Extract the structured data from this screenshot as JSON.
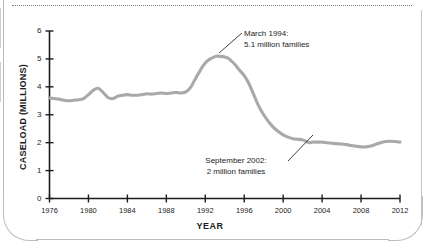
{
  "figure": {
    "y_axis_title": "CASELOAD (MILLIONS)",
    "x_axis_title": "YEAR",
    "line_color": "#a9a9a9",
    "text_color": "#1c1c1c"
  },
  "annotations": {
    "peak": {
      "line1": "March 1994:",
      "line2": "5.1 million families"
    },
    "trough": {
      "line1": "September 2002:",
      "line2": "2 million families"
    }
  },
  "chart_data": {
    "type": "line",
    "title": "",
    "xlabel": "YEAR",
    "ylabel": "CASELOAD (MILLIONS)",
    "xlim": [
      1976,
      2012
    ],
    "ylim": [
      0,
      6
    ],
    "xticks": [
      1976,
      1980,
      1984,
      1988,
      1992,
      1996,
      2000,
      2004,
      2008,
      2012
    ],
    "yticks": [
      0,
      1,
      2,
      3,
      4,
      5,
      6
    ],
    "grid": false,
    "legend": null,
    "series": [
      {
        "name": "AFDC/TANF caseload",
        "x": [
          1976,
          1976.5,
          1977,
          1977.5,
          1978,
          1978.5,
          1979,
          1979.5,
          1980,
          1980.5,
          1981,
          1981.5,
          1982,
          1982.5,
          1983,
          1983.5,
          1984,
          1984.5,
          1985,
          1985.5,
          1986,
          1986.5,
          1987,
          1987.5,
          1988,
          1988.5,
          1989,
          1989.5,
          1990,
          1990.5,
          1991,
          1991.5,
          1992,
          1992.5,
          1993,
          1993.25,
          1994.2,
          1994.6,
          1995,
          1995.5,
          1996,
          1996.5,
          1997,
          1997.5,
          1998,
          1998.5,
          1999,
          1999.5,
          2000,
          2000.5,
          2001,
          2001.5,
          2002,
          2002.7,
          2003,
          2003.5,
          2004,
          2004.5,
          2005,
          2005.5,
          2006,
          2006.5,
          2007,
          2007.5,
          2008,
          2008.5,
          2009,
          2009.5,
          2010,
          2010.5,
          2011,
          2011.5,
          2012
        ],
        "y": [
          3.6,
          3.58,
          3.56,
          3.52,
          3.5,
          3.52,
          3.54,
          3.58,
          3.72,
          3.88,
          3.95,
          3.8,
          3.62,
          3.58,
          3.66,
          3.7,
          3.72,
          3.7,
          3.7,
          3.72,
          3.75,
          3.74,
          3.76,
          3.78,
          3.76,
          3.78,
          3.8,
          3.78,
          3.82,
          3.98,
          4.3,
          4.6,
          4.85,
          5.0,
          5.08,
          5.1,
          5.05,
          4.95,
          4.82,
          4.6,
          4.4,
          4.1,
          3.7,
          3.3,
          3.0,
          2.75,
          2.55,
          2.4,
          2.28,
          2.2,
          2.14,
          2.12,
          2.1,
          2.0,
          2.02,
          2.02,
          2.02,
          2.0,
          1.98,
          1.96,
          1.95,
          1.93,
          1.9,
          1.87,
          1.85,
          1.85,
          1.88,
          1.94,
          2.0,
          2.04,
          2.05,
          2.04,
          2.02
        ],
        "markers": [
          {
            "label": "March 1994",
            "x": 1994.2,
            "y": 5.1
          },
          {
            "label": "September 2002",
            "x": 2002.7,
            "y": 2.0
          }
        ]
      }
    ]
  }
}
